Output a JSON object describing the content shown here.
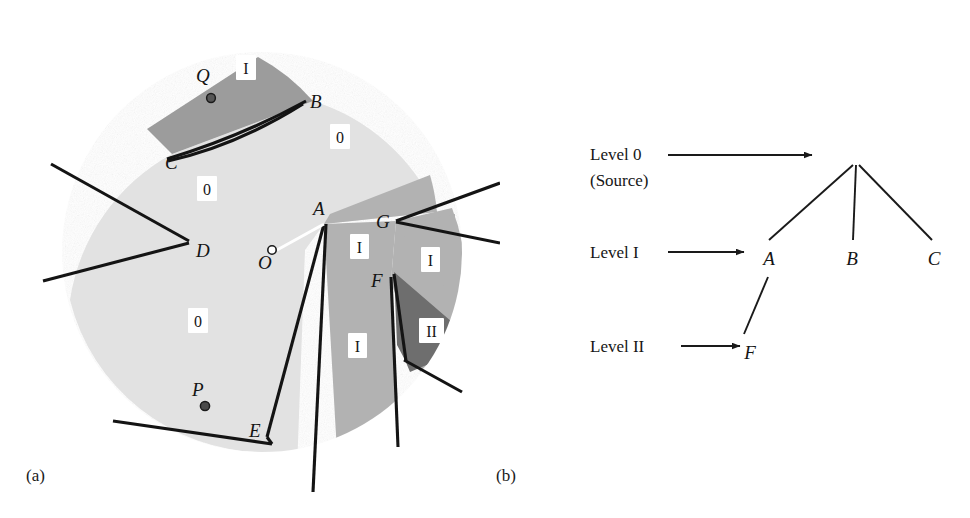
{
  "figure": {
    "panels": [
      {
        "id": "a",
        "label": "(a)",
        "caption_position": "bottom-left"
      },
      {
        "id": "b",
        "label": "(b)",
        "caption_position": "bottom-left"
      }
    ]
  },
  "diagram_a": {
    "name": "diffraction-shadow-zone-diagram",
    "source_point": {
      "label": "O",
      "x": 272,
      "y": 254,
      "marker": "open-circle"
    },
    "field_points": [
      {
        "label": "Q",
        "x": 205,
        "y": 74,
        "marker": "filled-circle",
        "dot_x": 211,
        "dot_y": 98
      },
      {
        "label": "P",
        "x": 197,
        "y": 388,
        "marker": "filled-circle",
        "dot_x": 205,
        "dot_y": 406
      }
    ],
    "edge_points": [
      {
        "label": "B",
        "x": 313,
        "y": 101
      },
      {
        "label": "C",
        "x": 172,
        "y": 154
      },
      {
        "label": "D",
        "x": 198,
        "y": 250
      },
      {
        "label": "E",
        "x": 259,
        "y": 430
      },
      {
        "label": "A",
        "x": 320,
        "y": 209
      },
      {
        "label": "G",
        "x": 382,
        "y": 221
      },
      {
        "label": "F",
        "x": 379,
        "y": 280
      }
    ],
    "region_labels": [
      {
        "text": "I",
        "x": 246,
        "y": 70,
        "zone": "shadow-one"
      },
      {
        "text": "0",
        "x": 339,
        "y": 139,
        "zone": "illuminated"
      },
      {
        "text": "0",
        "x": 206,
        "y": 191,
        "zone": "illuminated"
      },
      {
        "text": "0",
        "x": 197,
        "y": 323,
        "zone": "illuminated"
      },
      {
        "text": "I",
        "x": 359,
        "y": 249,
        "zone": "shadow-one"
      },
      {
        "text": "I",
        "x": 430,
        "y": 262,
        "zone": "shadow-one"
      },
      {
        "text": "I",
        "x": 357,
        "y": 348,
        "zone": "shadow-one"
      },
      {
        "text": "II",
        "x": 431,
        "y": 333,
        "zone": "shadow-two"
      }
    ],
    "colors": {
      "illuminated": "#e2e2e2",
      "shadow_one_light": "#b2b2b2",
      "shadow_one_dark": "#9c9c9c",
      "shadow_two": "#6e6e6e",
      "barrier": "#141414",
      "background": "#ffffff"
    },
    "legend_meaning": {
      "0": "Level 0 (directly illuminated / source field)",
      "I": "Level I (first-order diffracted shadow)",
      "II": "Level II (second-order diffracted shadow)"
    }
  },
  "diagram_b": {
    "name": "diffraction-level-tree",
    "levels": [
      {
        "id": "level0",
        "label_line1": "Level 0",
        "label_line2": "(Source)",
        "x": 590,
        "y": 155,
        "arrow_from_x": 668,
        "arrow_to_x": 810,
        "arrow_y": 155
      },
      {
        "id": "level1",
        "label_line1": "Level I",
        "label_line2": "",
        "x": 590,
        "y": 258,
        "arrow_from_x": 668,
        "arrow_to_x": 742,
        "arrow_y": 252
      },
      {
        "id": "level2",
        "label_line1": "Level II",
        "label_line2": "",
        "x": 590,
        "y": 352,
        "arrow_from_x": 680,
        "arrow_to_x": 742,
        "arrow_y": 346
      }
    ],
    "nodes": [
      {
        "label": "A",
        "x": 768,
        "y": 259,
        "level": "level1"
      },
      {
        "label": "B",
        "x": 852,
        "y": 259,
        "level": "level1"
      },
      {
        "label": "C",
        "x": 934,
        "y": 259,
        "level": "level1"
      },
      {
        "label": "F",
        "x": 762,
        "y": 353,
        "level": "level2"
      }
    ],
    "root": {
      "x": 855,
      "y": 162
    },
    "edges": [
      {
        "from": "root",
        "to": "A"
      },
      {
        "from": "root",
        "to": "B"
      },
      {
        "from": "root",
        "to": "C"
      },
      {
        "from": "A",
        "to": "F"
      }
    ]
  }
}
